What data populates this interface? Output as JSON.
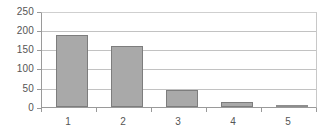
{
  "chart_data": {
    "type": "bar",
    "title": "",
    "subtitle": "",
    "xlabel": "",
    "ylabel": "",
    "categories": [
      "1",
      "2",
      "3",
      "4",
      "5"
    ],
    "values": [
      192,
      163,
      45,
      14,
      3
    ],
    "series": [
      {
        "name": "Frequency",
        "values": [
          192,
          163,
          45,
          14,
          3
        ]
      }
    ],
    "ylim": [
      0,
      250
    ],
    "ytick_labels": [
      "0",
      "50",
      "100",
      "150",
      "200",
      "250"
    ],
    "ytick_values": [
      0,
      50,
      100,
      150,
      200,
      250
    ],
    "xtick_labels": [
      "1",
      "2",
      "3",
      "4",
      "5"
    ],
    "grid": true,
    "grid_axis": "y",
    "legend": false,
    "legend_position": "none",
    "annotations": [],
    "colors": {
      "bar_fill": "#a9a9a9",
      "bar_border": "#7d7d7d",
      "gridline": "#c2c2c2",
      "axis": "#9a9a9a",
      "tick_text": "#555555",
      "background": "#ffffff"
    }
  }
}
